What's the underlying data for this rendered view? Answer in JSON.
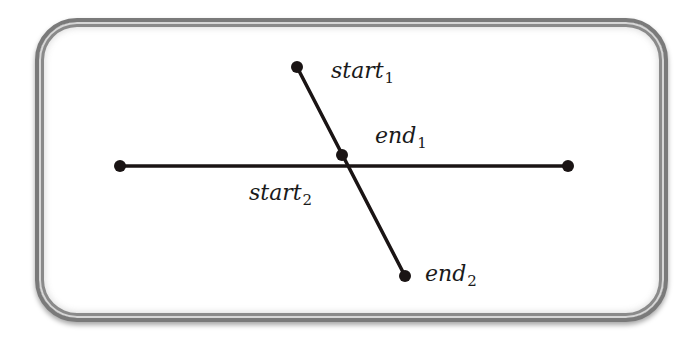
{
  "diagram": {
    "type": "line-segment-intersection",
    "frame": {
      "style": "rounded double border with shadow",
      "border_color": "#7a7a7a"
    },
    "stroke_color": "#1a1414",
    "segments": [
      {
        "id": "horizontal",
        "from": {
          "x": 120,
          "y": 166
        },
        "to": {
          "x": 568,
          "y": 166
        }
      },
      {
        "id": "segment-1",
        "from": {
          "x": 297,
          "y": 67
        },
        "to": {
          "x": 342,
          "y": 155
        }
      },
      {
        "id": "segment-2",
        "from": {
          "x": 342,
          "y": 155
        },
        "to": {
          "x": 405,
          "y": 276
        }
      }
    ],
    "points": [
      {
        "name": "horizontal-left",
        "x": 120,
        "y": 166
      },
      {
        "name": "horizontal-right",
        "x": 568,
        "y": 166
      },
      {
        "name": "start1",
        "x": 297,
        "y": 67
      },
      {
        "name": "end1",
        "x": 342,
        "y": 155
      },
      {
        "name": "end2",
        "x": 405,
        "y": 276
      }
    ],
    "labels": {
      "start1": {
        "base": "start",
        "sub": "1"
      },
      "end1": {
        "base": "end",
        "sub": "1"
      },
      "start2": {
        "base": "start",
        "sub": "2"
      },
      "end2": {
        "base": "end",
        "sub": "2"
      }
    }
  }
}
